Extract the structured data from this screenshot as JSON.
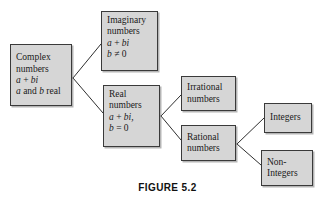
{
  "figure": {
    "caption": "FIGURE 5.2",
    "box_fill_color": "#d6d6d6",
    "box_border_color": "#3a3a3a",
    "line_color": "#2e2e2e",
    "background_color": "#ffffff"
  },
  "nodes": {
    "complex": {
      "line1": "Complex",
      "line2": "numbers",
      "line3_a": "a",
      "line3_op": " + ",
      "line3_bi": "bi",
      "line4_a": "a",
      "line4_and": " and ",
      "line4_b": "b",
      "line4_real": " real"
    },
    "imaginary": {
      "line1": "Imaginary",
      "line2": "numbers",
      "line3_a": "a",
      "line3_op": " + ",
      "line3_bi": "bi",
      "line4_b": "b",
      "line4_cond": " ≠ 0"
    },
    "real": {
      "line1": "Real",
      "line2": "numbers",
      "line3_a": "a",
      "line3_op": " + ",
      "line3_bi": "bi,",
      "line4_b": "b",
      "line4_cond": " = 0"
    },
    "irrational": {
      "line1": "Irrational",
      "line2": "numbers"
    },
    "rational": {
      "line1": "Rational",
      "line2": "numbers"
    },
    "integers": {
      "line1": "Integers"
    },
    "noninteger": {
      "line1": "Non-",
      "line2": "Integers"
    }
  },
  "edges": [
    {
      "name": "complex-to-imaginary",
      "from": "complex",
      "to": "imaginary"
    },
    {
      "name": "complex-to-real",
      "from": "complex",
      "to": "real"
    },
    {
      "name": "real-to-irrational",
      "from": "real",
      "to": "irrational"
    },
    {
      "name": "real-to-rational",
      "from": "real",
      "to": "rational"
    },
    {
      "name": "rational-to-integers",
      "from": "rational",
      "to": "integers"
    },
    {
      "name": "rational-to-noninteger",
      "from": "rational",
      "to": "noninteger"
    }
  ]
}
